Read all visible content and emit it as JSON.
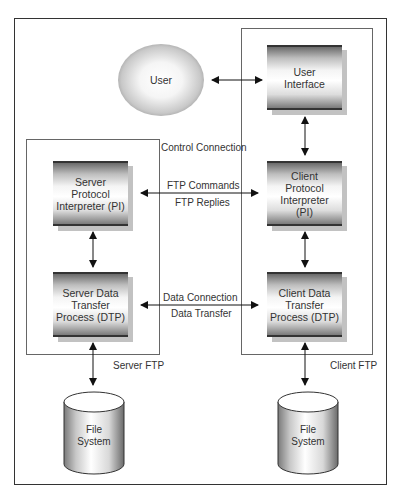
{
  "diagram": {
    "nodes": {
      "user": {
        "label": "User",
        "shape": "ellipse"
      },
      "user_interface": {
        "label": "User\nInterface",
        "shape": "box"
      },
      "server_pi": {
        "label": "Server\nProtocol\nInterpreter (PI)",
        "shape": "box"
      },
      "client_pi": {
        "label": "Client\nProtocol\nInterpreter\n(PI)",
        "shape": "box"
      },
      "server_dtp": {
        "label": "Server Data\nTransfer\nProcess (DTP)",
        "shape": "box"
      },
      "client_dtp": {
        "label": "Client Data\nTransfer\nProcess (DTP)",
        "shape": "box"
      },
      "server_fs": {
        "label": "File\nSystem",
        "shape": "cylinder"
      },
      "client_fs": {
        "label": "File\nSystem",
        "shape": "cylinder"
      }
    },
    "groups": {
      "server_ftp": {
        "label": "Server FTP"
      },
      "client_ftp": {
        "label": "Client FTP"
      }
    },
    "connections": {
      "control": {
        "label": "Control Connection",
        "upper": "FTP Commands",
        "lower": "FTP Replies"
      },
      "data": {
        "upper": "Data Connection",
        "lower": "Data Transfer"
      }
    },
    "edges": [
      {
        "from": "user",
        "to": "user_interface",
        "bidirectional": true
      },
      {
        "from": "user_interface",
        "to": "client_pi",
        "bidirectional": true
      },
      {
        "from": "server_pi",
        "to": "client_pi",
        "bidirectional": true
      },
      {
        "from": "server_pi",
        "to": "server_dtp",
        "bidirectional": true
      },
      {
        "from": "client_pi",
        "to": "client_dtp",
        "bidirectional": true
      },
      {
        "from": "server_dtp",
        "to": "client_dtp",
        "bidirectional": true
      },
      {
        "from": "server_dtp",
        "to": "server_fs",
        "bidirectional": true
      },
      {
        "from": "client_dtp",
        "to": "client_fs",
        "bidirectional": true
      }
    ],
    "colors": {
      "line": "#222222",
      "frame": "#333333",
      "shadow": "#c2c2c2"
    }
  }
}
